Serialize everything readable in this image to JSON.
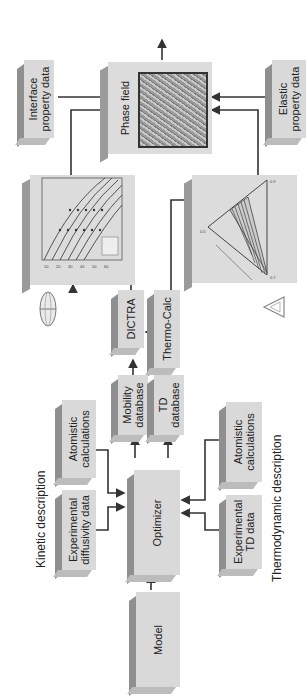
{
  "diagram": {
    "orientation": "rotated 90 degrees counter-clockwise",
    "section_labels": {
      "kinetic": "Kinetic description",
      "thermodynamic": "Thermodynamic description"
    },
    "nodes": {
      "model": "Model",
      "optimizer": "Optimizer",
      "experimental_diffusivity": "Experimental\ndiffusivity data",
      "atomistic_kinetic": "Atomistic\ncalculations",
      "experimental_td": "Experimental\nTD data",
      "atomistic_td": "Atomistic\ncalculations",
      "mobility_db": "Mobility\ndatabase",
      "td_db": "TD\ndatabase",
      "dictra": "DICTRA",
      "thermo_calc": "Thermo-Calc",
      "phase_field": "Phase field",
      "interface_data": "Interface\nproperty data",
      "elastic_data": "Elastic\nproperty data"
    },
    "icons": {
      "dictra_logo": "ellipse-globe-logo",
      "thermocalc_logo": "triangle-logo"
    },
    "plots": {
      "diffusion_plot": "Diffusion profile curves plot",
      "phase_diagram": "Ternary / isothermal phase diagram with hatched tie-line region"
    },
    "colors": {
      "box_face": "#d9d9d9",
      "box_side": "#8f8f8f",
      "arrow": "#333333"
    }
  }
}
